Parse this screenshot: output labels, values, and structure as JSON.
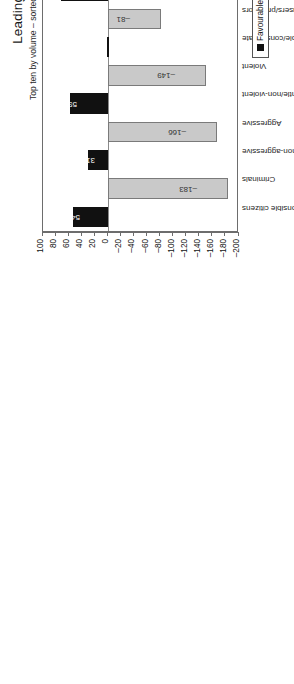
{
  "chart_data": {
    "type": "bar",
    "title": "Leading messages about men",
    "subtitle": "Top ten by volume – sorted by corresponding positive and negative messages",
    "xlabel": "",
    "ylabel": "",
    "ylim": [
      -200,
      100
    ],
    "yticks": [
      -200,
      -180,
      -160,
      -140,
      -120,
      -100,
      -80,
      -60,
      -40,
      -20,
      0,
      20,
      40,
      60,
      80,
      100
    ],
    "grid": false,
    "legend_position": "bottom-right",
    "categories": [
      "Law – abiding responsible citizens",
      "Criminals",
      "Strong active but non-aggressive",
      "Aggressive",
      "Protectors/carers/gentle/non-violent",
      "Violent",
      "Sexually responsible/considerate",
      "Sexual abusers/predators",
      "Commitment orientated and responsible",
      "Commitment phobic/lack commitment",
      "Treat women equally/with respect",
      "Chauvinists/oppressors/misogynists",
      "Intelligent and capable",
      "Stupid or incompetent",
      "Sensitive",
      "Insensitive, out of touch with feelings",
      "Traditional men/male behaviour",
      "Snags/metrosexuals/shows 'feminine' behaviour",
      "Share power/rights/opportunities",
      "Power focussed/obsessed"
    ],
    "series": [
      {
        "name": "Favourable",
        "color": "#111111",
        "values": [
          54,
          null,
          31,
          null,
          59,
          null,
          2,
          null,
          73,
          null,
          13,
          null,
          35,
          null,
          35,
          null,
          14,
          null,
          13,
          null
        ]
      },
      {
        "name": "Unfavourable",
        "color": "#c9c9c9",
        "values": [
          null,
          -183,
          null,
          -166,
          null,
          -149,
          null,
          -81,
          null,
          -43,
          null,
          -61,
          null,
          -58,
          null,
          -57,
          null,
          -43,
          null,
          -39
        ]
      }
    ],
    "bars": [
      {
        "category": "Law – abiding responsible citizens",
        "value": 54,
        "series": "Favourable",
        "label": "54"
      },
      {
        "category": "Criminals",
        "value": -183,
        "series": "Unfavourable",
        "label": "–183"
      },
      {
        "category": "Strong active but non-aggressive",
        "value": 31,
        "series": "Favourable",
        "label": "31"
      },
      {
        "category": "Aggressive",
        "value": -166,
        "series": "Unfavourable",
        "label": "–166"
      },
      {
        "category": "Protectors/carers/gentle/non-violent",
        "value": 59,
        "series": "Favourable",
        "label": "59"
      },
      {
        "category": "Violent",
        "value": -149,
        "series": "Unfavourable",
        "label": "–149"
      },
      {
        "category": "Sexually responsible/considerate",
        "value": 2,
        "series": "Favourable",
        "label": ""
      },
      {
        "category": "Sexual abusers/predators",
        "value": -81,
        "series": "Unfavourable",
        "label": "–81"
      },
      {
        "category": "Commitment orientated and responsible",
        "value": 73,
        "series": "Favourable",
        "label": "73"
      },
      {
        "category": "Commitment phobic/lack commitment",
        "value": -43,
        "series": "Unfavourable",
        "label": "–43"
      },
      {
        "category": "Treat women equally/with respect",
        "value": 13,
        "series": "Favourable",
        "label": "13"
      },
      {
        "category": "Chauvinists/oppressors/misogynists",
        "value": -61,
        "series": "Unfavourable",
        "label": "–61"
      },
      {
        "category": "Intelligent and capable",
        "value": 35,
        "series": "Favourable",
        "label": "35"
      },
      {
        "category": "Stupid or incompetent",
        "value": -58,
        "series": "Unfavourable",
        "label": "–58"
      },
      {
        "category": "Sensitive",
        "value": 35,
        "series": "Favourable",
        "label": "35"
      },
      {
        "category": "Insensitive, out of touch with feelings",
        "value": -57,
        "series": "Unfavourable",
        "label": "–57"
      },
      {
        "category": "Traditional men/male behaviour",
        "value": 14,
        "series": "Favourable",
        "label": "14"
      },
      {
        "category": "Snags/metrosexuals/shows 'feminine' behaviour",
        "value": -43,
        "series": "Unfavourable",
        "label": "–43"
      },
      {
        "category": "Share power/rights/opportunities",
        "value": 13,
        "series": "Favourable",
        "label": "13"
      },
      {
        "category": "Power focussed/obsessed",
        "value": -39,
        "series": "Unfavourable",
        "label": "–39"
      }
    ],
    "legend": [
      {
        "label": "Favourable",
        "color": "#111111"
      },
      {
        "label": "Unfavourable",
        "color": "#d8d8d8"
      }
    ]
  }
}
